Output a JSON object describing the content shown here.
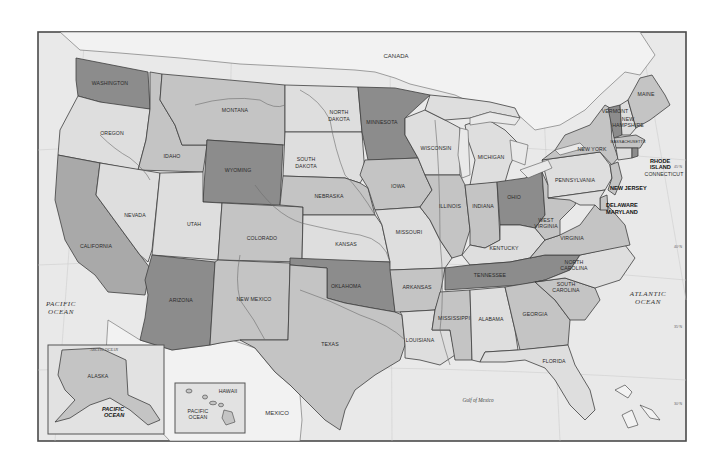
{
  "map": {
    "title": "United States",
    "colors": {
      "shade_dark": "#8c8c8c",
      "shade_mid": "#a9a9a9",
      "shade_light": "#c4c4c4",
      "shade_pale": "#dedede",
      "water": "#e9e9e9",
      "foreign_land": "#f3f3f3",
      "border": "#3f3f3f"
    },
    "countries": {
      "canada": "CANADA",
      "mexico": "MEXICO"
    },
    "water_bodies": {
      "pacific_line1": "PACIFIC",
      "pacific_line2": "OCEAN",
      "atlantic_line1": "ATLANTIC",
      "atlantic_line2": "OCEAN",
      "gulf": "Gulf of Mexico",
      "arctic": "ARCTIC OCEAN"
    },
    "states": {
      "WA": "WASHINGTON",
      "OR": "OREGON",
      "CA": "CALIFORNIA",
      "ID": "IDAHO",
      "NV": "NEVADA",
      "MT": "MONTANA",
      "WY": "WYOMING",
      "UT": "UTAH",
      "AZ": "ARIZONA",
      "CO": "COLORADO",
      "NM": "NEW MEXICO",
      "ND_1": "NORTH",
      "ND_2": "DAKOTA",
      "SD_1": "SOUTH",
      "SD_2": "DAKOTA",
      "NE": "NEBRASKA",
      "KS": "KANSAS",
      "OK": "OKLAHOMA",
      "TX": "TEXAS",
      "MN": "MINNESOTA",
      "IA": "IOWA",
      "MO": "MISSOURI",
      "AR": "ARKANSAS",
      "LA": "LOUISIANA",
      "WI": "WISCONSIN",
      "IL": "ILLINOIS",
      "MI": "MICHIGAN",
      "IN": "INDIANA",
      "OH": "OHIO",
      "KY": "KENTUCKY",
      "TN": "TENNESSEE",
      "MS": "MISSISSIPPI",
      "AL": "ALABAMA",
      "GA": "GEORGIA",
      "FL": "FLORIDA",
      "SC_1": "SOUTH",
      "SC_2": "CAROLINA",
      "NC_1": "NORTH",
      "NC_2": "CAROLINA",
      "VA": "VIRGINIA",
      "WV_1": "WEST",
      "WV_2": "VIRGINIA",
      "PA": "PENNSYLVANIA",
      "NY": "NEW YORK",
      "VT": "VERMONT",
      "NH_1": "NEW",
      "NH_2": "HAMPSHIRE",
      "ME": "MAINE",
      "MA": "MASSACHUSETTS",
      "RI_1": "RHODE",
      "RI_2": "ISLAND",
      "CT": "CONNECTICUT",
      "NJ": "NEW JERSEY",
      "DE": "DELAWARE",
      "MD": "MARYLAND",
      "AK": "ALASKA",
      "HI": "HAWAII"
    },
    "insets": {
      "alaska": {
        "label": "ALASKA",
        "ocean_line1": "PACIFIC",
        "ocean_line2": "OCEAN",
        "arctic": "ARCTIC OCEAN"
      },
      "hawaii": {
        "label": "HAWAII",
        "ocean_line1": "PACIFIC",
        "ocean_line2": "OCEAN"
      }
    },
    "graticule": {
      "longitude_ticks": [
        "125°W",
        "120°W",
        "115°W",
        "110°W",
        "105°W",
        "100°W",
        "95°W",
        "90°W",
        "85°W",
        "80°W",
        "75°W",
        "70°W"
      ],
      "latitude_ticks": [
        "45°N",
        "40°N",
        "35°N",
        "30°N",
        "25°N"
      ]
    }
  }
}
